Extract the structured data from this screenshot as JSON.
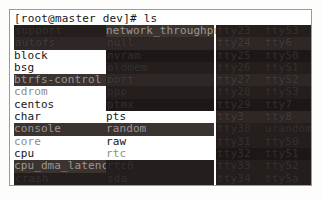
{
  "window": {
    "title": "Terminal",
    "background_color": "#ffffff",
    "border_color": "#9a9a96",
    "text_color": "#16161a"
  },
  "prompt": {
    "full": "[root@master dev]# ls",
    "user_host": "[root@master dev]#",
    "command": "ls",
    "cursor": "block"
  },
  "listing": {
    "path": "/dev",
    "columns": [
      {
        "name": "column-1",
        "entries": [
          {
            "label": "support",
            "style": "blocky"
          },
          {
            "label": "autofs",
            "style": "blocky"
          },
          {
            "label": "block",
            "style": "plain"
          },
          {
            "label": "bsg",
            "style": "plain"
          },
          {
            "label": "btrfs-control",
            "style": "hl"
          },
          {
            "label": "cdrom",
            "style": "faint"
          },
          {
            "label": "centos",
            "style": "plain"
          },
          {
            "label": "char",
            "style": "plain"
          },
          {
            "label": "console",
            "style": "hl"
          },
          {
            "label": "core",
            "style": "faint"
          },
          {
            "label": "cpu",
            "style": "plain"
          },
          {
            "label": "cpu_dma_latency",
            "style": "hl"
          },
          {
            "label": "crash",
            "style": "blocky"
          },
          {
            "label": "disk",
            "style": "plain"
          },
          {
            "label": "dm-0",
            "style": "blocky"
          }
        ]
      },
      {
        "name": "column-2",
        "entries": [
          {
            "label": "network_throughput",
            "style": "hl"
          },
          {
            "label": "null",
            "style": "blocky"
          },
          {
            "label": "nvram",
            "style": "blocky"
          },
          {
            "label": "oldmem",
            "style": "blocky"
          },
          {
            "label": "port",
            "style": "blocky"
          },
          {
            "label": "ppp",
            "style": "blocky"
          },
          {
            "label": "ptmx",
            "style": "blocky"
          },
          {
            "label": "pts",
            "style": "plain"
          },
          {
            "label": "random",
            "style": "hl"
          },
          {
            "label": "raw",
            "style": "plain"
          },
          {
            "label": "rtc",
            "style": "faint"
          },
          {
            "label": "rtc0",
            "style": "blocky"
          },
          {
            "label": "sda",
            "style": "blocky"
          },
          {
            "label": "sda1",
            "style": "blocky"
          },
          {
            "label": "sda2",
            "style": "blocky"
          }
        ]
      },
      {
        "name": "column-3",
        "entries": [
          {
            "label": "tty23",
            "style": "blocky"
          },
          {
            "label": "tty24",
            "style": "blocky"
          },
          {
            "label": "tty25",
            "style": "blocky"
          },
          {
            "label": "tty26",
            "style": "blocky"
          },
          {
            "label": "tty27",
            "style": "blocky"
          },
          {
            "label": "tty28",
            "style": "blocky"
          },
          {
            "label": "tty29",
            "style": "blocky"
          },
          {
            "label": "tty3",
            "style": "blocky"
          },
          {
            "label": "tty30",
            "style": "blocky"
          },
          {
            "label": "tty31",
            "style": "blocky"
          },
          {
            "label": "tty32",
            "style": "blocky"
          },
          {
            "label": "tty33",
            "style": "blocky"
          },
          {
            "label": "tty34",
            "style": "blocky"
          },
          {
            "label": "tty35",
            "style": "blocky"
          },
          {
            "label": "tty36",
            "style": "blocky"
          }
        ]
      },
      {
        "name": "column-4",
        "entries": [
          {
            "label": "tty53",
            "style": "blocky"
          },
          {
            "label": "tty6",
            "style": "blocky"
          },
          {
            "label": "ttyS0",
            "style": "blocky"
          },
          {
            "label": "ttyS1",
            "style": "blocky"
          },
          {
            "label": "ttyS2",
            "style": "blocky"
          },
          {
            "label": "ttyS3",
            "style": "blocky"
          },
          {
            "label": "tty7",
            "style": "blocky"
          },
          {
            "label": "tty8",
            "style": "blocky"
          },
          {
            "label": "urandom",
            "style": "blocky"
          },
          {
            "label": "tty50",
            "style": "blocky"
          },
          {
            "label": "tty51",
            "style": "blocky"
          },
          {
            "label": "tty52",
            "style": "blocky"
          },
          {
            "label": "tty5a",
            "style": "blocky"
          },
          {
            "label": "uhid",
            "style": "blocky"
          },
          {
            "label": "uinput",
            "style": "blocky"
          }
        ]
      }
    ]
  }
}
